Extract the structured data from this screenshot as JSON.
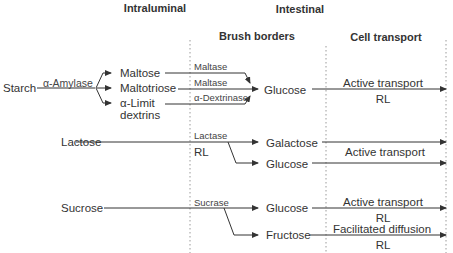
{
  "headers": {
    "intraluminal": "Intraluminal",
    "intestinal": "Intestinal",
    "brush_borders": "Brush borders",
    "cell_transport": "Cell transport"
  },
  "starch_row": {
    "substrate": "Starch",
    "enzyme": "α-Amylase",
    "products": [
      "Maltose",
      "Maltotriose",
      "α-Limit",
      "dextrins"
    ],
    "brush_enzymes": [
      "Maltase",
      "Maltase",
      "α-Dextrinase"
    ],
    "result": "Glucose",
    "transport": "Active transport",
    "transport_note": "RL"
  },
  "lactose_row": {
    "substrate": "Lactose",
    "enzyme": "Lactase",
    "enzyme_note": "RL",
    "products": [
      "Galactose",
      "Glucose"
    ],
    "transport": "Active transport"
  },
  "sucrose_row": {
    "substrate": "Sucrose",
    "enzyme": "Sucrase",
    "products": [
      "Glucose",
      "Fructose"
    ],
    "transports": [
      {
        "label": "Active transport",
        "note": "RL"
      },
      {
        "label": "Facilitated diffusion",
        "note": "RL"
      }
    ]
  },
  "colors": {
    "line": "#333333",
    "divider": "#999999",
    "text": "#333333"
  }
}
